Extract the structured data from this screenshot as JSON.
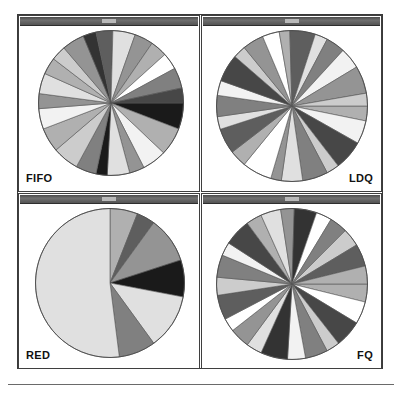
{
  "figure": {
    "background_color": "#ffffff",
    "frame_color": "#3a3a3a",
    "titlebar_color": "#5c5c5c",
    "rule_color": "#6a6a6a",
    "panel_titlebar_text": ""
  },
  "panels": [
    {
      "id": "fifo",
      "label": "FIFO",
      "label_position": "bottom-left",
      "position": "top-left"
    },
    {
      "id": "ldq",
      "label": "LDQ",
      "label_position": "bottom-right",
      "position": "top-right"
    },
    {
      "id": "red",
      "label": "RED",
      "label_position": "bottom-left",
      "position": "bottom-left"
    },
    {
      "id": "fq",
      "label": "FQ",
      "label_position": "bottom-right",
      "position": "bottom-right"
    }
  ],
  "palette": {
    "white": "#ffffff",
    "near_white": "#f2f2f2",
    "light": "#e0e0e0",
    "light_mid": "#cccccc",
    "mid": "#b0b0b0",
    "mid_dark": "#949494",
    "gray": "#808080",
    "dark_gray": "#5e5e5e",
    "dark": "#474747",
    "darker": "#333333",
    "black": "#1a1a1a",
    "edge": "#555555"
  },
  "chart_data": [
    {
      "type": "pie",
      "title": "FIFO",
      "panel": "top-left",
      "start_angle_deg": 0,
      "direction": "clockwise",
      "edge_color": "#555555",
      "legend": "none",
      "slices": [
        {
          "value": 7.0,
          "color": "#1a1a1a"
        },
        {
          "value": 7.5,
          "color": "#b0b0b0"
        },
        {
          "value": 6.5,
          "color": "#f2f2f2"
        },
        {
          "value": 4.0,
          "color": "#949494"
        },
        {
          "value": 6.0,
          "color": "#e0e0e0"
        },
        {
          "value": 3.0,
          "color": "#1a1a1a"
        },
        {
          "value": 5.5,
          "color": "#808080"
        },
        {
          "value": 7.0,
          "color": "#cccccc"
        },
        {
          "value": 6.5,
          "color": "#b0b0b0"
        },
        {
          "value": 5.5,
          "color": "#f2f2f2"
        },
        {
          "value": 4.0,
          "color": "#949494"
        },
        {
          "value": 5.5,
          "color": "#e0e0e0"
        },
        {
          "value": 4.5,
          "color": "#b0b0b0"
        },
        {
          "value": 4.0,
          "color": "#cccccc"
        },
        {
          "value": 6.0,
          "color": "#949494"
        },
        {
          "value": 3.5,
          "color": "#333333"
        },
        {
          "value": 4.5,
          "color": "#5e5e5e"
        },
        {
          "value": 6.0,
          "color": "#e0e0e0"
        },
        {
          "value": 5.0,
          "color": "#949494"
        },
        {
          "value": 4.5,
          "color": "#b0b0b0"
        },
        {
          "value": 4.5,
          "color": "#ffffff"
        },
        {
          "value": 5.5,
          "color": "#808080"
        },
        {
          "value": 4.0,
          "color": "#474747"
        }
      ]
    },
    {
      "type": "pie",
      "title": "LDQ",
      "panel": "top-right",
      "start_angle_deg": 0,
      "direction": "clockwise",
      "edge_color": "#555555",
      "legend": "none",
      "slices": [
        {
          "value": 3.5,
          "color": "#b0b0b0"
        },
        {
          "value": 5.5,
          "color": "#f2f2f2"
        },
        {
          "value": 7.0,
          "color": "#474747"
        },
        {
          "value": 3.0,
          "color": "#cccccc"
        },
        {
          "value": 6.0,
          "color": "#808080"
        },
        {
          "value": 5.0,
          "color": "#e0e0e0"
        },
        {
          "value": 2.5,
          "color": "#949494"
        },
        {
          "value": 7.0,
          "color": "#ffffff"
        },
        {
          "value": 4.0,
          "color": "#b0b0b0"
        },
        {
          "value": 6.0,
          "color": "#5e5e5e"
        },
        {
          "value": 3.0,
          "color": "#e0e0e0"
        },
        {
          "value": 5.0,
          "color": "#808080"
        },
        {
          "value": 3.5,
          "color": "#f2f2f2"
        },
        {
          "value": 6.5,
          "color": "#474747"
        },
        {
          "value": 3.0,
          "color": "#cccccc"
        },
        {
          "value": 5.0,
          "color": "#949494"
        },
        {
          "value": 4.0,
          "color": "#ffffff"
        },
        {
          "value": 2.5,
          "color": "#b0b0b0"
        },
        {
          "value": 6.0,
          "color": "#5e5e5e"
        },
        {
          "value": 3.0,
          "color": "#e0e0e0"
        },
        {
          "value": 4.5,
          "color": "#808080"
        },
        {
          "value": 5.0,
          "color": "#f2f2f2"
        },
        {
          "value": 6.5,
          "color": "#949494"
        },
        {
          "value": 3.0,
          "color": "#cccccc"
        }
      ]
    },
    {
      "type": "pie",
      "title": "RED",
      "panel": "bottom-left",
      "start_angle_deg": 90,
      "direction": "clockwise",
      "edge_color": "#555555",
      "legend": "none",
      "slices": [
        {
          "value": 6.0,
          "color": "#b0b0b0"
        },
        {
          "value": 4.0,
          "color": "#5e5e5e"
        },
        {
          "value": 10.0,
          "color": "#949494"
        },
        {
          "value": 8.0,
          "color": "#1a1a1a"
        },
        {
          "value": 12.0,
          "color": "#e0e0e0"
        },
        {
          "value": 8.0,
          "color": "#808080"
        },
        {
          "value": 52.0,
          "color": "#e0e0e0"
        }
      ]
    },
    {
      "type": "pie",
      "title": "FQ",
      "panel": "bottom-right",
      "start_angle_deg": 0,
      "direction": "clockwise",
      "edge_color": "#555555",
      "legend": "none",
      "slices": [
        {
          "value": 4.0,
          "color": "#b0b0b0"
        },
        {
          "value": 5.0,
          "color": "#ffffff"
        },
        {
          "value": 6.0,
          "color": "#474747"
        },
        {
          "value": 3.0,
          "color": "#cccccc"
        },
        {
          "value": 5.0,
          "color": "#808080"
        },
        {
          "value": 4.0,
          "color": "#f2f2f2"
        },
        {
          "value": 6.0,
          "color": "#333333"
        },
        {
          "value": 3.5,
          "color": "#e0e0e0"
        },
        {
          "value": 4.5,
          "color": "#949494"
        },
        {
          "value": 3.0,
          "color": "#ffffff"
        },
        {
          "value": 5.5,
          "color": "#5e5e5e"
        },
        {
          "value": 4.0,
          "color": "#cccccc"
        },
        {
          "value": 5.0,
          "color": "#808080"
        },
        {
          "value": 3.0,
          "color": "#f2f2f2"
        },
        {
          "value": 6.0,
          "color": "#474747"
        },
        {
          "value": 3.5,
          "color": "#b0b0b0"
        },
        {
          "value": 4.5,
          "color": "#e0e0e0"
        },
        {
          "value": 3.0,
          "color": "#949494"
        },
        {
          "value": 5.0,
          "color": "#333333"
        },
        {
          "value": 3.5,
          "color": "#ffffff"
        },
        {
          "value": 4.0,
          "color": "#808080"
        },
        {
          "value": 4.0,
          "color": "#cccccc"
        },
        {
          "value": 5.0,
          "color": "#5e5e5e"
        },
        {
          "value": 4.0,
          "color": "#b0b0b0"
        }
      ]
    }
  ]
}
